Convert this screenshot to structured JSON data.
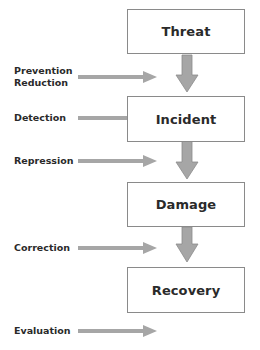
{
  "diagram": {
    "stages": [
      {
        "label": "Threat",
        "top": 9
      },
      {
        "label": "Incident",
        "top": 96
      },
      {
        "label": "Damage",
        "top": 182
      },
      {
        "label": "Recovery",
        "top": 267
      }
    ],
    "measures": [
      {
        "label": "Prevention\nReduction",
        "top": 65,
        "arrow_y": 77
      },
      {
        "label": "Detection",
        "top": 112,
        "arrow_y": 118
      },
      {
        "label": "Repression",
        "top": 155,
        "arrow_y": 161
      },
      {
        "label": "Correction",
        "top": 242,
        "arrow_y": 248
      },
      {
        "label": "Evaluation",
        "top": 325,
        "arrow_y": 331
      }
    ],
    "colors": {
      "arrow": "#a6a6a6",
      "arrow_outline": "#8c8c8c",
      "box_border": "#8a8a8a",
      "text": "#2a2a2a"
    }
  }
}
